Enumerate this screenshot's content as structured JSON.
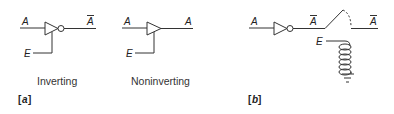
{
  "figure": {
    "panel_a": {
      "label": "a",
      "inverting": {
        "caption": "Inverting",
        "input_label": "A",
        "output_label": "A",
        "output_overbar": true,
        "enable_label": "E"
      },
      "noninverting": {
        "caption": "Noninverting",
        "input_label": "A",
        "output_label": "A",
        "output_overbar": false,
        "enable_label": "E"
      }
    },
    "panel_b": {
      "label": "b",
      "input_label": "A",
      "inverter_output_label": "A",
      "switch_output_label": "A",
      "enable_label": "E",
      "components": [
        "inverter",
        "relay-switch",
        "relay-coil",
        "ground"
      ]
    }
  },
  "colors": {
    "line": "#333333",
    "background": "#ffffff"
  }
}
